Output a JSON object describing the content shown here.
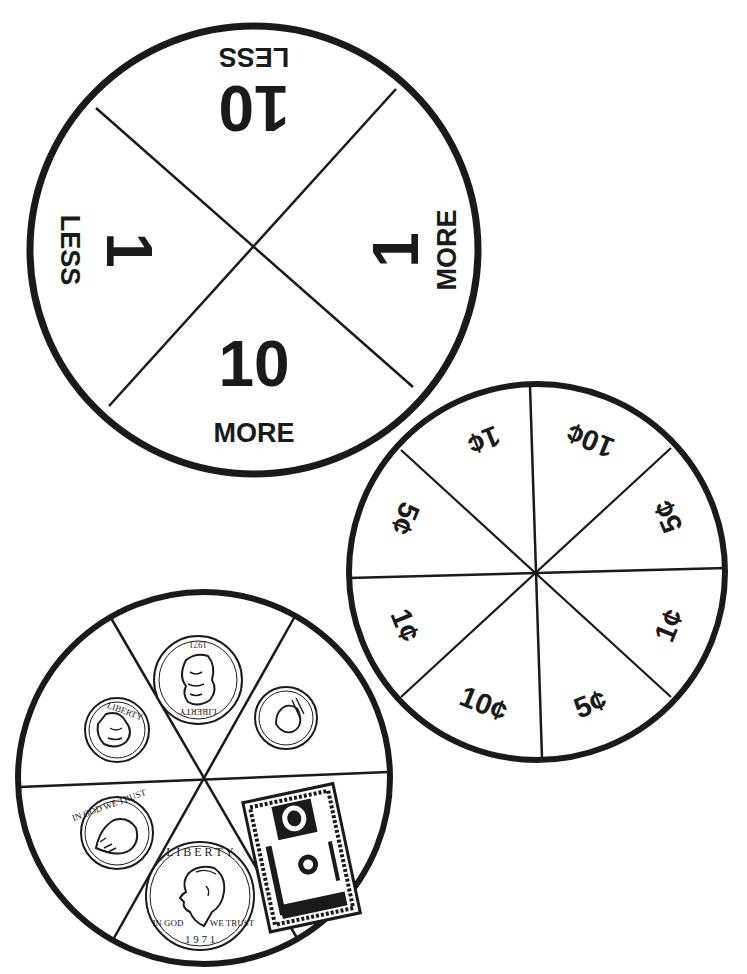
{
  "page": {
    "colors": {
      "ink": "#1a1a1a",
      "paper": "#ffffff"
    }
  },
  "spinner_more_less": {
    "sections": [
      {
        "position": "top",
        "number": "10",
        "word": "LESS",
        "rotation": 180
      },
      {
        "position": "right",
        "number": "1",
        "word": "MORE",
        "rotation": -90
      },
      {
        "position": "bottom",
        "number": "10",
        "word": "MORE",
        "rotation": 0
      },
      {
        "position": "left",
        "number": "1",
        "word": "LESS",
        "rotation": 90
      }
    ]
  },
  "spinner_cents": {
    "sections": [
      {
        "label": "10¢"
      },
      {
        "label": "5¢"
      },
      {
        "label": "1¢"
      },
      {
        "label": "5¢"
      },
      {
        "label": "10¢"
      },
      {
        "label": "1¢"
      },
      {
        "label": "5¢"
      },
      {
        "label": "1¢"
      }
    ]
  },
  "spinner_money": {
    "sections": [
      {
        "item": "quarter",
        "icon": "quarter-coin-icon",
        "text": [
          "LIBERTY",
          "1971",
          "IN GOD WE TRUST"
        ]
      },
      {
        "item": "penny",
        "icon": "penny-coin-icon",
        "text": [
          "IN GOD WE TRUST"
        ]
      },
      {
        "item": "dollar bill",
        "icon": "dollar-bill-icon",
        "text": [
          "THE UNITED STATES OF AMERICA"
        ]
      },
      {
        "item": "half dollar",
        "icon": "half-dollar-coin-icon",
        "text": [
          "LIBERTY",
          "IN GOD",
          "WE TRUST",
          "1971"
        ]
      },
      {
        "item": "nickel",
        "icon": "nickel-coin-icon",
        "text": [
          "IN GOD WE TRUST",
          "LIBERTY"
        ]
      },
      {
        "item": "dime",
        "icon": "dime-coin-icon",
        "text": [
          "LIBERTY"
        ]
      }
    ]
  }
}
